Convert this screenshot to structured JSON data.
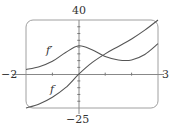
{
  "chart_data": {
    "type": "line",
    "title": "",
    "xlabel": "",
    "ylabel": "",
    "xlim": [
      -2,
      3
    ],
    "ylim": [
      -25,
      40
    ],
    "grid": false,
    "axis_labels": {
      "x_min": "−2",
      "x_max": "3",
      "y_max": "40",
      "y_min": "−25"
    },
    "x_ticks": [
      -1,
      1,
      2
    ],
    "y_ticks": [
      -20,
      -15,
      -10,
      -5,
      5,
      10,
      15,
      20,
      25,
      30,
      35
    ],
    "series": [
      {
        "name": "f'",
        "label": "f′",
        "x": [
          -2,
          -1.5,
          -1,
          -0.5,
          0,
          0.5,
          1,
          1.5,
          2,
          2.5,
          3
        ],
        "y": [
          3.5,
          5.5,
          9.5,
          16,
          21,
          18,
          13,
          10.5,
          10.5,
          14.5,
          22.5
        ]
      },
      {
        "name": "f",
        "label": "f",
        "x": [
          -2,
          -1.5,
          -1,
          -0.5,
          0,
          0.5,
          1,
          1.5,
          2,
          2.5,
          3
        ],
        "y": [
          -25,
          -22,
          -17,
          -10,
          0,
          8.5,
          15,
          20.5,
          26,
          32.5,
          40
        ]
      }
    ]
  },
  "labels": {
    "y_max": "40",
    "y_min": "−25",
    "x_min": "−2",
    "x_max": "3",
    "f_prime": "f′",
    "f": "f"
  },
  "colors": {
    "curve": "#555555",
    "axis": "#777777",
    "frame": "#999999"
  }
}
